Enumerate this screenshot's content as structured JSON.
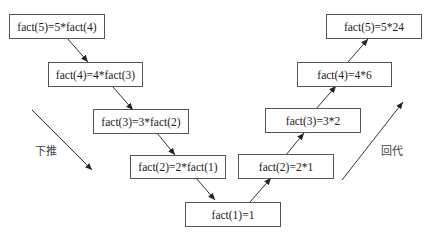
{
  "diagram": {
    "descend_label": "下推",
    "ascend_label": "回代",
    "descend_boxes": [
      {
        "text": "fact(5)=5*fact(4)"
      },
      {
        "text": "fact(4)=4*fact(3)"
      },
      {
        "text": "fact(3)=3*fact(2)"
      },
      {
        "text": "fact(2)=2*fact(1)"
      }
    ],
    "base_box": {
      "text": "fact(1)=1"
    },
    "ascend_boxes": [
      {
        "text": "fact(2)=2*1"
      },
      {
        "text": "fact(3)=3*2"
      },
      {
        "text": "fact(4)=4*6"
      },
      {
        "text": "fact(5)=5*24"
      }
    ]
  }
}
